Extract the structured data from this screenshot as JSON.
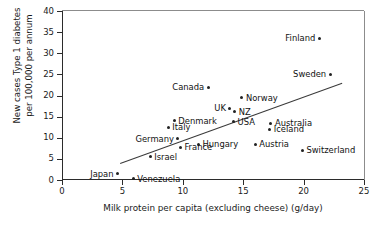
{
  "chart_data": {
    "type": "scatter",
    "title": "",
    "xlabel": "Milk protein per capita (excluding cheese) (g/day)",
    "ylabel": "New cases Type 1 diabetes per 100,000 per annum",
    "ylabel_line1": "New cases Type 1 diabetes",
    "ylabel_line2": "per 100,000 per annum",
    "xlim": [
      0,
      25
    ],
    "ylim": [
      0,
      40
    ],
    "xticks": [
      0,
      5,
      10,
      15,
      20,
      25
    ],
    "yticks": [
      0,
      5,
      10,
      15,
      20,
      25,
      30,
      35,
      40
    ],
    "grid": false,
    "legend": "none",
    "marker_color": "#222222",
    "trendline": {
      "present": true,
      "x_start": 4.8,
      "y_start": 4.0,
      "x_end": 23.2,
      "y_end": 23.0,
      "color": "#3a3a3a"
    },
    "points": [
      {
        "label": "Finland",
        "x": 21.3,
        "y": 33.5,
        "label_side": "left"
      },
      {
        "label": "Sweden",
        "x": 22.2,
        "y": 25.0,
        "label_side": "left"
      },
      {
        "label": "Canada",
        "x": 12.1,
        "y": 22.0,
        "label_side": "left"
      },
      {
        "label": "Norway",
        "x": 14.9,
        "y": 19.5,
        "label_side": "right"
      },
      {
        "label": "UK",
        "x": 13.9,
        "y": 17.0,
        "label_side": "left"
      },
      {
        "label": "NZ",
        "x": 14.3,
        "y": 16.2,
        "label_side": "right"
      },
      {
        "label": "Denmark",
        "x": 9.3,
        "y": 14.0,
        "label_side": "right"
      },
      {
        "label": "USA",
        "x": 14.2,
        "y": 13.8,
        "label_side": "right"
      },
      {
        "label": "Australia",
        "x": 17.3,
        "y": 13.4,
        "label_side": "right"
      },
      {
        "label": "Italy",
        "x": 8.8,
        "y": 12.5,
        "label_side": "right"
      },
      {
        "label": "Iceland",
        "x": 17.2,
        "y": 12.0,
        "label_side": "right"
      },
      {
        "label": "Germany",
        "x": 9.6,
        "y": 9.8,
        "label_side": "left"
      },
      {
        "label": "Austria",
        "x": 16.0,
        "y": 8.5,
        "label_side": "right"
      },
      {
        "label": "Hungary",
        "x": 11.3,
        "y": 8.5,
        "label_side": "right"
      },
      {
        "label": "France",
        "x": 9.8,
        "y": 7.8,
        "label_side": "right"
      },
      {
        "label": "Switzerland",
        "x": 19.9,
        "y": 7.0,
        "label_side": "right"
      },
      {
        "label": "Israel",
        "x": 7.3,
        "y": 5.5,
        "label_side": "right"
      },
      {
        "label": "Japan",
        "x": 4.6,
        "y": 1.5,
        "label_side": "left"
      },
      {
        "label": "Venezuela",
        "x": 5.9,
        "y": 0.3,
        "label_side": "right"
      }
    ]
  }
}
